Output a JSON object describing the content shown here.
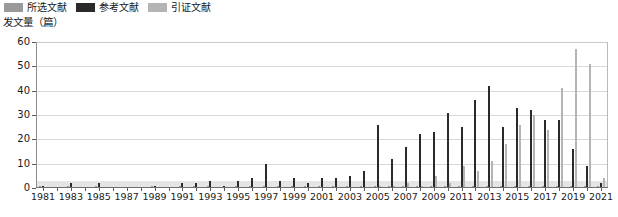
{
  "legend": {
    "position": "top-left",
    "items": [
      {
        "label": "所选文献",
        "color": "#9a9a9a",
        "key": "selected"
      },
      {
        "label": "参考文献",
        "color": "#2a2a2a",
        "key": "references"
      },
      {
        "label": "引证文献",
        "color": "#b4b4b4",
        "key": "citations"
      }
    ]
  },
  "axis": {
    "y_title": "发文量（篇）",
    "y_ticks": [
      0,
      10,
      20,
      30,
      40,
      50,
      60
    ],
    "x_tick_labels": [
      "1981",
      "1983",
      "1985",
      "1987",
      "1989",
      "1991",
      "1993",
      "1995",
      "1997",
      "1999",
      "2001",
      "2003",
      "2005",
      "2007",
      "2009",
      "2011",
      "2013",
      "2015",
      "2017",
      "2019",
      "2021"
    ]
  },
  "chart_data": {
    "type": "bar",
    "title": "",
    "xlabel": "",
    "ylabel": "发文量（篇）",
    "ylim": [
      0,
      60
    ],
    "grid": true,
    "legend_position": "top-left",
    "categories": [
      "1981",
      "1982",
      "1983",
      "1984",
      "1985",
      "1986",
      "1987",
      "1988",
      "1989",
      "1990",
      "1991",
      "1992",
      "1993",
      "1994",
      "1995",
      "1996",
      "1997",
      "1998",
      "1999",
      "2000",
      "2001",
      "2002",
      "2003",
      "2004",
      "2005",
      "2006",
      "2007",
      "2008",
      "2009",
      "2010",
      "2011",
      "2012",
      "2013",
      "2014",
      "2015",
      "2016",
      "2017",
      "2018",
      "2019",
      "2020",
      "2021"
    ],
    "series": [
      {
        "name": "所选文献",
        "color": "#9a9a9a",
        "values": [
          1,
          0,
          1,
          0,
          1,
          0,
          0,
          0,
          1,
          0,
          1,
          1,
          1,
          0,
          1,
          1,
          1,
          1,
          1,
          1,
          1,
          1,
          1,
          1,
          1,
          1,
          1,
          1,
          1,
          1,
          1,
          1,
          1,
          1,
          1,
          1,
          1,
          1,
          1,
          1,
          1
        ]
      },
      {
        "name": "参考文献",
        "color": "#2a2a2a",
        "values": [
          1,
          0,
          2,
          0,
          2,
          0,
          0,
          0,
          1,
          0,
          2,
          2,
          3,
          1,
          3,
          4,
          10,
          3,
          4,
          2,
          4,
          4,
          5,
          7,
          26,
          12,
          17,
          22,
          23,
          31,
          25,
          36,
          42,
          25,
          33,
          32,
          28,
          28,
          16,
          9,
          2
        ]
      },
      {
        "name": "引证文献",
        "color": "#b4b4b4",
        "values": [
          0,
          0,
          0,
          0,
          0,
          0,
          0,
          0,
          0,
          0,
          0,
          0,
          0,
          0,
          0,
          0,
          0,
          0,
          0,
          0,
          0,
          0,
          0,
          0,
          1,
          1,
          2,
          1,
          5,
          2,
          9,
          7,
          11,
          18,
          26,
          30,
          24,
          41,
          57,
          51,
          4
        ]
      }
    ]
  }
}
